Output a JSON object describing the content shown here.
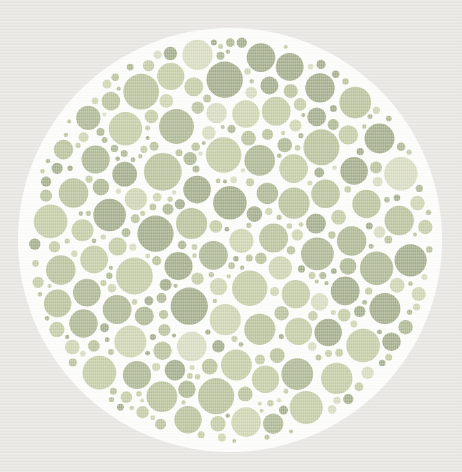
{
  "plate": {
    "canvas": {
      "width": 462,
      "height": 472
    },
    "page_background": "#e9e8e4",
    "backdrop_color": "#fdfdfa",
    "center_x": 230,
    "center_y": 240,
    "backdrop_radius": 212,
    "dot_area_radius": 204,
    "dot_gap": 1.8,
    "seed": 20240607,
    "palette": [
      {
        "color": "#a2ad87",
        "weight": 3
      },
      {
        "color": "#adb890",
        "weight": 3
      },
      {
        "color": "#b9c399",
        "weight": 3
      },
      {
        "color": "#c5cda2",
        "weight": 3
      },
      {
        "color": "#cfd5ae",
        "weight": 2
      },
      {
        "color": "#d9ddbe",
        "weight": 1
      }
    ],
    "size_tiers": [
      {
        "r_min": 13.5,
        "r_max": 19.0,
        "attempts": 1400
      },
      {
        "r_min": 9.0,
        "r_max": 13.5,
        "attempts": 1800
      },
      {
        "r_min": 5.5,
        "r_max": 9.0,
        "attempts": 2600
      },
      {
        "r_min": 3.2,
        "r_max": 5.5,
        "attempts": 3200
      },
      {
        "r_min": 2.0,
        "r_max": 3.2,
        "attempts": 2600
      }
    ],
    "texture": {
      "stripe_color": "#ffffff",
      "stripe_opacity": 0.2
    }
  }
}
